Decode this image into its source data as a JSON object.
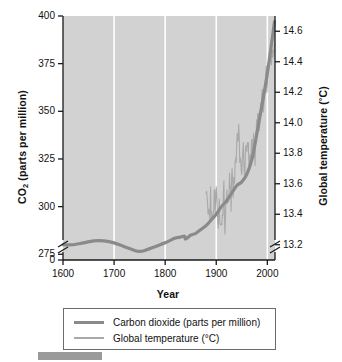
{
  "chart_data": {
    "type": "line",
    "title": "",
    "subtitle": "",
    "xlabel": "Year",
    "ylabel": "CO2 (parts per million)",
    "ylabel_right": "Global temperature (°C)",
    "xlim": [
      1600,
      2015
    ],
    "ylim": [
      272,
      400
    ],
    "ylim_right": [
      13.1,
      14.7
    ],
    "grid": "vertical-white-gridlines-at-x-ticks",
    "legend_position": "below-plot",
    "axis_break_left": true,
    "axis_break_right": true,
    "xticks": [
      "1600",
      "1700",
      "1800",
      "1900",
      "2000"
    ],
    "xtick_values": [
      1600,
      1700,
      1800,
      1900,
      2000
    ],
    "yticks_left": [
      "0",
      "275",
      "300",
      "325",
      "350",
      "375",
      "400"
    ],
    "ytick_values_left": [
      0,
      275,
      300,
      325,
      350,
      375,
      400
    ],
    "yticks_right": [
      "13.2",
      "13.4",
      "13.6",
      "13.8",
      "14.0",
      "14.2",
      "14.4",
      "14.6"
    ],
    "ytick_values_right": [
      13.2,
      13.4,
      13.6,
      13.8,
      14.0,
      14.2,
      14.4,
      14.6
    ],
    "series": [
      {
        "name": "Carbon dioxide (parts per million)",
        "axis": "left",
        "color": "#8a8a8a",
        "width": 3.2,
        "x": [
          1600,
          1620,
          1640,
          1660,
          1680,
          1700,
          1720,
          1740,
          1750,
          1760,
          1780,
          1800,
          1820,
          1830,
          1838,
          1840,
          1850,
          1860,
          1870,
          1880,
          1890,
          1900,
          1910,
          1920,
          1930,
          1940,
          1950,
          1960,
          1970,
          1980,
          1990,
          2000,
          2010,
          2014
        ],
        "values": [
          280,
          280,
          281,
          282,
          282,
          281,
          279,
          277,
          276.5,
          277,
          279,
          281,
          283.5,
          284,
          284.5,
          283,
          285,
          286,
          288,
          290,
          293,
          296,
          300,
          303,
          307,
          311,
          313,
          317,
          325,
          339,
          354,
          370,
          389,
          397
        ]
      },
      {
        "name": "Global temperature (°C)",
        "axis": "right",
        "color": "#a9a9a9",
        "width": 1.1,
        "x": [
          1880,
          1881,
          1882,
          1883,
          1884,
          1885,
          1886,
          1887,
          1888,
          1889,
          1890,
          1891,
          1892,
          1893,
          1894,
          1895,
          1896,
          1897,
          1898,
          1899,
          1900,
          1901,
          1902,
          1903,
          1904,
          1905,
          1906,
          1907,
          1908,
          1909,
          1910,
          1911,
          1912,
          1913,
          1914,
          1915,
          1916,
          1917,
          1918,
          1919,
          1920,
          1921,
          1922,
          1923,
          1924,
          1925,
          1926,
          1927,
          1928,
          1929,
          1930,
          1931,
          1932,
          1933,
          1934,
          1935,
          1936,
          1937,
          1938,
          1939,
          1940,
          1941,
          1942,
          1943,
          1944,
          1945,
          1946,
          1947,
          1948,
          1949,
          1950,
          1951,
          1952,
          1953,
          1954,
          1955,
          1956,
          1957,
          1958,
          1959,
          1960,
          1961,
          1962,
          1963,
          1964,
          1965,
          1966,
          1967,
          1968,
          1969,
          1970,
          1971,
          1972,
          1973,
          1974,
          1975,
          1976,
          1977,
          1978,
          1979,
          1980,
          1981,
          1982,
          1983,
          1984,
          1985,
          1986,
          1987,
          1988,
          1989,
          1990,
          1991,
          1992,
          1993,
          1994,
          1995,
          1996,
          1997,
          1998,
          1999,
          2000,
          2001,
          2002,
          2003,
          2004,
          2005,
          2006,
          2007,
          2008,
          2009,
          2010,
          2011,
          2012,
          2013,
          2014
        ],
        "values": [
          13.54,
          13.55,
          13.52,
          13.47,
          13.4,
          13.43,
          13.43,
          13.37,
          13.45,
          13.58,
          13.38,
          13.42,
          13.37,
          13.37,
          13.4,
          13.43,
          13.56,
          13.56,
          13.41,
          13.51,
          13.58,
          13.52,
          13.42,
          13.35,
          13.31,
          13.42,
          13.5,
          13.34,
          13.33,
          13.33,
          13.34,
          13.33,
          13.4,
          13.39,
          13.55,
          13.62,
          13.38,
          13.27,
          13.38,
          13.49,
          13.5,
          13.56,
          13.47,
          13.51,
          13.48,
          13.54,
          13.67,
          13.57,
          13.58,
          13.42,
          13.64,
          13.7,
          13.63,
          13.51,
          13.64,
          13.6,
          13.61,
          13.74,
          13.77,
          13.74,
          13.85,
          13.93,
          13.88,
          13.89,
          13.99,
          13.9,
          13.74,
          13.77,
          13.75,
          13.68,
          13.66,
          13.77,
          13.81,
          13.87,
          13.73,
          13.67,
          13.65,
          13.81,
          13.85,
          13.85,
          13.81,
          13.87,
          13.85,
          13.87,
          13.69,
          13.72,
          13.79,
          13.78,
          13.76,
          13.89,
          13.89,
          13.78,
          13.8,
          13.93,
          13.77,
          13.81,
          13.72,
          13.94,
          13.92,
          14.02,
          13.94,
          14.06,
          13.99,
          14.06,
          13.95,
          13.98,
          14.08,
          14.13,
          14.08,
          14.18,
          14.22,
          14.12,
          14.07,
          14.1,
          14.17,
          14.22,
          14.2,
          14.31,
          14.37,
          14.2,
          14.26,
          14.34,
          14.39,
          14.41,
          14.39,
          14.4,
          14.42,
          14.45,
          14.38,
          14.44,
          14.48,
          14.43,
          14.47,
          14.46,
          14.52
        ]
      }
    ]
  },
  "axes": {
    "xlabel": "Year",
    "ylabel_left_main": "CO",
    "ylabel_left_sub": "2",
    "ylabel_left_rest": " (parts per million)",
    "ylabel_right_main": "Global temperature (",
    "ylabel_right_deg": "°",
    "ylabel_right_rest": "C)",
    "xticks": [
      "1600",
      "1700",
      "1800",
      "1900",
      "2000"
    ],
    "yticks_left": [
      "400",
      "375",
      "350",
      "325",
      "300",
      "275",
      "0"
    ],
    "yticks_right": [
      "14.6",
      "14.4",
      "14.2",
      "14.0",
      "13.8",
      "13.6",
      "13.4",
      "13.2"
    ]
  },
  "legend": {
    "items": [
      {
        "label": "Carbon dioxide (parts per million)",
        "color": "#8a8a8a",
        "style": "thick"
      },
      {
        "label": "Global temperature (°C)",
        "color": "#a9a9a9",
        "style": "thin"
      }
    ]
  },
  "colors": {
    "plot_background": "#d2d2d2",
    "gridline": "#ffffff",
    "co2_line": "#8a8a8a",
    "temperature_line": "#a9a9a9",
    "axis": "#1a1a1a",
    "text": "#111111",
    "page_background": "#ffffff",
    "corner_bar": "#9a9a9a"
  }
}
